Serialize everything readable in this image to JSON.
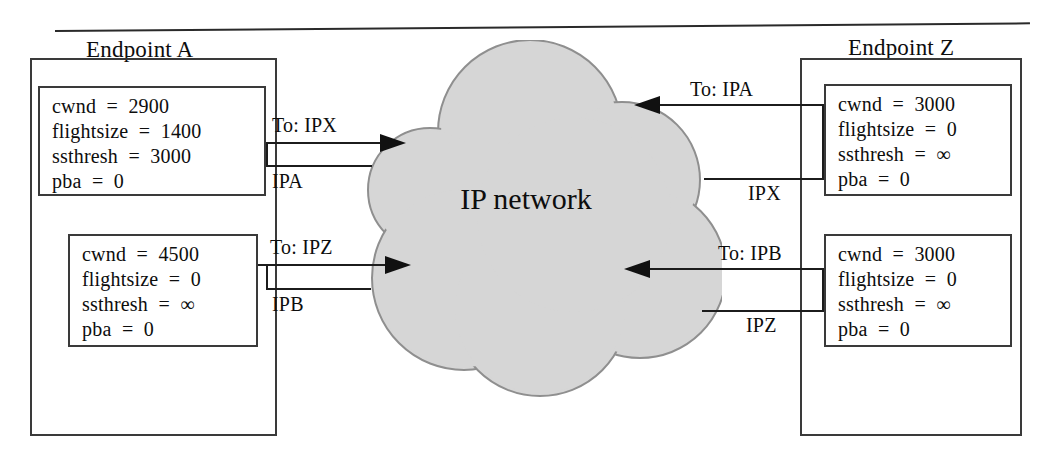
{
  "diagram": {
    "cloud_label": "IP network",
    "cloud_fill": "#d6d6d6",
    "cloud_stroke": "#8f8f8f",
    "line_color": "#1c1c1c"
  },
  "endpoint_a": {
    "title": "Endpoint A",
    "state_boxes": [
      {
        "lines": [
          "cwnd  =  2900",
          "flightsize  =  1400",
          "ssthresh  =  3000",
          "pba  =  0"
        ]
      },
      {
        "lines": [
          "cwnd  =  4500",
          "flightsize  =  0",
          "ssthresh  =  ∞",
          "pba  =  0"
        ]
      }
    ],
    "links": [
      {
        "to_label": "To: IPX",
        "src_label": "IPA"
      },
      {
        "to_label": "To: IPZ",
        "src_label": "IPB"
      }
    ]
  },
  "endpoint_z": {
    "title": "Endpoint Z",
    "state_boxes": [
      {
        "lines": [
          "cwnd  =  3000",
          "flightsize  =  0",
          "ssthresh  =  ∞",
          "pba  =  0"
        ]
      },
      {
        "lines": [
          "cwnd  =  3000",
          "flightsize  =  0",
          "ssthresh  =  ∞",
          "pba  =  0"
        ]
      }
    ],
    "links": [
      {
        "to_label": "To: IPA",
        "src_label": "IPX"
      },
      {
        "to_label": "To: IPB",
        "src_label": "IPZ"
      }
    ]
  }
}
